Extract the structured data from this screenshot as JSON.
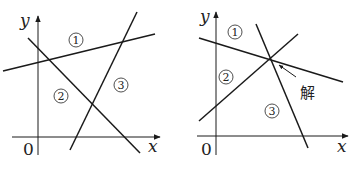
{
  "panels": [
    {
      "name": "left-graph",
      "axis_labels": {
        "x": "x",
        "y": "y",
        "origin": "0"
      },
      "regions": [
        {
          "label": "1",
          "x": 76,
          "y": 40
        },
        {
          "label": "2",
          "x": 61,
          "y": 96
        },
        {
          "label": "3",
          "x": 121,
          "y": 85
        }
      ]
    },
    {
      "name": "right-graph",
      "axis_labels": {
        "x": "x",
        "y": "y",
        "origin": "0"
      },
      "regions": [
        {
          "label": "1",
          "x": 235,
          "y": 32
        },
        {
          "label": "2",
          "x": 226,
          "y": 77
        },
        {
          "label": "3",
          "x": 272,
          "y": 111
        }
      ],
      "annotation": "解"
    }
  ]
}
